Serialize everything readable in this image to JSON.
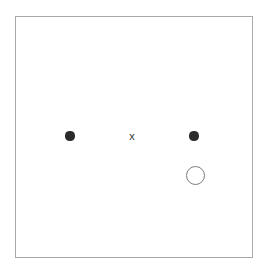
{
  "figure": {
    "title": "",
    "background_color": "#ffffff",
    "frame": {
      "name": "plot-frame",
      "x": 15,
      "y": 16,
      "width": 238,
      "height": 242,
      "border_color": "#a9a9a9",
      "border_width": 1,
      "fill_color": "#ffffff"
    }
  },
  "chart_data": {
    "type": "scatter",
    "title": "",
    "xlabel": "",
    "ylabel": "",
    "xlim": [
      0,
      238
    ],
    "ylim": [
      0,
      242
    ],
    "grid": false,
    "legend": null,
    "axis_ticks": {
      "x": [],
      "y": []
    },
    "series": [
      {
        "name": "filled-points",
        "marker": "filled-circle",
        "color": "#2b2b2b",
        "size_px": 9,
        "points": [
          {
            "label": "left-point",
            "x": 70,
            "y": 136
          },
          {
            "label": "right-point",
            "x": 194,
            "y": 136
          }
        ]
      },
      {
        "name": "cross-point",
        "marker": "x",
        "glyph": "x",
        "color": "#3a3a3a",
        "size_px": 8,
        "points": [
          {
            "label": "center-x",
            "x": 132,
            "y": 136
          }
        ]
      },
      {
        "name": "open-point",
        "marker": "open-circle",
        "color": "#7d7d7d",
        "size_px": 19,
        "stroke_width": 1.6,
        "points": [
          {
            "label": "lower-right-open-circle",
            "x": 195,
            "y": 175
          }
        ]
      }
    ]
  },
  "markers": [
    {
      "id": "dot-left",
      "name": "data-point-dot-left",
      "kind": "filled-circle",
      "cx": 70,
      "cy": 136,
      "r": 4.6,
      "color": "#2b2b2b"
    },
    {
      "id": "marker-x-center",
      "name": "data-point-x-center",
      "kind": "x-glyph",
      "glyph": "x",
      "cx": 132,
      "cy": 136,
      "size": 11,
      "color": "#3a3a3a"
    },
    {
      "id": "dot-right",
      "name": "data-point-dot-right",
      "kind": "filled-circle",
      "cx": 194,
      "cy": 136,
      "r": 4.6,
      "color": "#2b2b2b"
    },
    {
      "id": "circle-open",
      "name": "data-point-open-circle",
      "kind": "open-circle",
      "cx": 195,
      "cy": 175,
      "r": 9.5,
      "color": "#7d7d7d",
      "stroke_width": 1.6
    }
  ]
}
